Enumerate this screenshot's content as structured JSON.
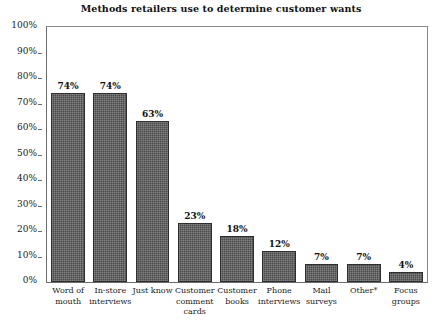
{
  "chart_data": {
    "type": "bar",
    "title": "Methods retailers use to determine customer wants",
    "xlabel": "",
    "ylabel": "",
    "ylim": [
      0,
      100
    ],
    "grid": false,
    "legend": "none",
    "orientation": "vertical",
    "value_suffix": "%",
    "categories": [
      "Word of mouth",
      "In-store interviews",
      "Just know",
      "Customer comment cards",
      "Customer books",
      "Phone interviews",
      "Mail surveys",
      "Other*",
      "Focus groups"
    ],
    "category_lines": [
      [
        "Word of",
        "mouth"
      ],
      [
        "In-store",
        "interviews"
      ],
      [
        "Just know"
      ],
      [
        "Customer",
        "comment",
        "cards"
      ],
      [
        "Customer",
        "books"
      ],
      [
        "Phone",
        "interviews"
      ],
      [
        "Mail",
        "surveys"
      ],
      [
        "Other*"
      ],
      [
        "Focus",
        "groups"
      ]
    ],
    "values": [
      74,
      74,
      63,
      23,
      18,
      12,
      7,
      7,
      4
    ],
    "value_labels": [
      "74%",
      "74%",
      "63%",
      "23%",
      "18%",
      "12%",
      "7%",
      "7%",
      "4%"
    ],
    "yticks": [
      0,
      10,
      20,
      30,
      40,
      50,
      60,
      70,
      80,
      90,
      100
    ],
    "ytick_labels": [
      "0%",
      "10%",
      "20%",
      "30%",
      "40%",
      "50%",
      "60%",
      "70%",
      "80%",
      "90%",
      "100%"
    ],
    "bar_color": "#4a4a4a",
    "bar_edge_color": "#2e2e2e",
    "axis_color": "#6b6b6b",
    "background_color": "#ffffff",
    "text_color": "#1a1a1a"
  }
}
